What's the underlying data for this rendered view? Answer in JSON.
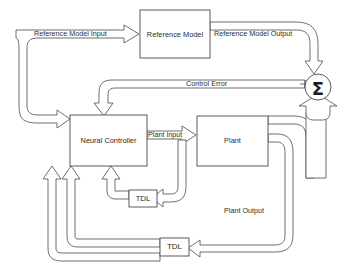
{
  "diagram": {
    "type": "block-diagram",
    "line_color": "#4a4a4a",
    "fill_color": "#ffffff",
    "text_color": "#2b2b2b",
    "background": "#ffffff",
    "blocks": [
      {
        "id": "reference_model",
        "label": "Reference Model",
        "x": 140,
        "y": 10,
        "w": 70,
        "h": 48
      },
      {
        "id": "neural_controller",
        "label": "Neural Controller",
        "x": 70,
        "y": 115,
        "w": 77,
        "h": 51
      },
      {
        "id": "plant",
        "label": "Plant",
        "x": 197,
        "y": 116,
        "w": 71,
        "h": 50
      },
      {
        "id": "tdl_upper",
        "label": "TDL",
        "x": 129,
        "y": 190,
        "w": 28,
        "h": 17
      },
      {
        "id": "tdl_lower",
        "label": "TDL",
        "x": 160,
        "y": 238,
        "w": 29,
        "h": 18
      }
    ],
    "nodes": [
      {
        "id": "summation",
        "label": "Σ",
        "cx": 318,
        "cy": 87,
        "r": 13
      }
    ],
    "signals": [
      {
        "id": "reference_model_input",
        "label": "Reference Model Input"
      },
      {
        "id": "reference_model_output",
        "label": "Reference Model Output"
      },
      {
        "id": "control_error",
        "label": "Control Error"
      },
      {
        "id": "plant_input",
        "label": "Plant Input"
      },
      {
        "id": "plant_output",
        "label": "Plant Output"
      }
    ]
  },
  "labels": {
    "reference_model": "Reference Model",
    "reference_model_input": "Reference Model Input",
    "reference_model_output": "Reference Model Output",
    "control_error": "Control Error",
    "neural_controller": "Neural Controller",
    "plant_input": "Plant Input",
    "plant": "Plant",
    "plant_output": "Plant Output",
    "tdl_upper": "TDL",
    "tdl_lower": "TDL",
    "summation": "Σ"
  }
}
